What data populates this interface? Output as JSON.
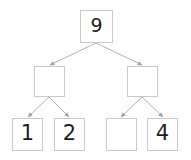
{
  "diagram": {
    "type": "tree",
    "background_color": "#fdfdfd",
    "node_border_color": "#c9c9c9",
    "node_fill_color": "#ffffff",
    "edge_color": "#a9a9a9",
    "text_color": "#1d1d1d",
    "nodes": [
      {
        "id": "root",
        "label": "9",
        "level": 0,
        "x": 80,
        "y": 10,
        "w": 33,
        "h": 33
      },
      {
        "id": "mid-left",
        "label": "",
        "level": 1,
        "x": 34,
        "y": 66,
        "w": 31,
        "h": 31
      },
      {
        "id": "mid-right",
        "label": "",
        "level": 1,
        "x": 127,
        "y": 66,
        "w": 31,
        "h": 31
      },
      {
        "id": "leaf-1",
        "label": "1",
        "level": 2,
        "x": 12,
        "y": 118,
        "w": 31,
        "h": 33
      },
      {
        "id": "leaf-2",
        "label": "2",
        "level": 2,
        "x": 54,
        "y": 118,
        "w": 31,
        "h": 33
      },
      {
        "id": "leaf-3",
        "label": "",
        "level": 2,
        "x": 106,
        "y": 118,
        "w": 31,
        "h": 33
      },
      {
        "id": "leaf-4",
        "label": "4",
        "level": 2,
        "x": 147,
        "y": 118,
        "w": 31,
        "h": 33
      }
    ],
    "edges": [
      {
        "id": "edge-root-mid-left",
        "from": "root",
        "to": "mid-left",
        "x1": 96,
        "y1": 43,
        "x2": 50,
        "y2": 65
      },
      {
        "id": "edge-root-mid-right",
        "from": "root",
        "to": "mid-right",
        "x1": 96,
        "y1": 43,
        "x2": 142,
        "y2": 65
      },
      {
        "id": "edge-mid-left-leaf-1",
        "from": "mid-left",
        "to": "leaf-1",
        "x1": 49,
        "y1": 97,
        "x2": 28,
        "y2": 117
      },
      {
        "id": "edge-mid-left-leaf-2",
        "from": "mid-left",
        "to": "leaf-2",
        "x1": 49,
        "y1": 97,
        "x2": 69,
        "y2": 117
      },
      {
        "id": "edge-mid-right-leaf-3",
        "from": "mid-right",
        "to": "leaf-3",
        "x1": 142,
        "y1": 97,
        "x2": 121,
        "y2": 117
      },
      {
        "id": "edge-mid-right-leaf-4",
        "from": "mid-right",
        "to": "leaf-4",
        "x1": 142,
        "y1": 97,
        "x2": 163,
        "y2": 117
      }
    ]
  }
}
